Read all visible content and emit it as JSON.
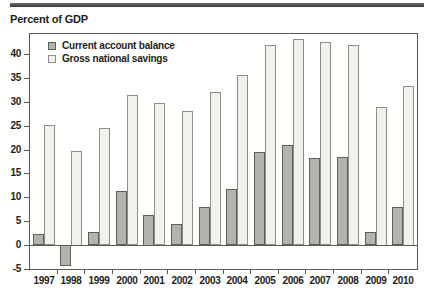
{
  "page": {
    "title": "Percent of GDP"
  },
  "colors": {
    "current_fill": "#b3b2ae",
    "current_border": "#5f5e5b",
    "savings_fill": "#f2f1ed",
    "savings_border": "#8e8d89",
    "frame": "#5a5955",
    "text": "#1e1d1b",
    "rule": "#454442",
    "background": "#fffffe"
  },
  "chart_data": {
    "type": "bar",
    "title": "Percent of GDP",
    "categories": [
      "1997",
      "1998",
      "1999",
      "2000",
      "2001",
      "2002",
      "2003",
      "2004",
      "2005",
      "2006",
      "2007",
      "2008",
      "2009",
      "2010"
    ],
    "series": [
      {
        "name": "Current account balance",
        "values": [
          2.4,
          -4.3,
          2.8,
          11.4,
          6.4,
          4.5,
          8.0,
          11.8,
          19.4,
          21.0,
          18.2,
          18.5,
          2.8,
          8.0
        ]
      },
      {
        "name": "Gross national savings",
        "values": [
          25.2,
          19.8,
          24.5,
          31.5,
          29.8,
          28.0,
          32.0,
          35.6,
          41.9,
          43.1,
          42.5,
          41.8,
          29.0,
          33.4
        ]
      }
    ],
    "xlabel": "",
    "ylabel": "Percent of GDP",
    "ylim": [
      -5,
      44.2
    ],
    "yticks": [
      -5,
      0,
      5,
      10,
      15,
      20,
      25,
      30,
      35,
      40
    ],
    "legend_position": "top-left",
    "grid": false
  }
}
